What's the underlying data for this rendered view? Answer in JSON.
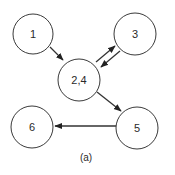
{
  "diagram": {
    "caption": "(a)",
    "nodes": [
      {
        "id": "1",
        "label": "1",
        "cx": 33,
        "cy": 34,
        "r": 20
      },
      {
        "id": "3",
        "label": "3",
        "cx": 135,
        "cy": 34,
        "r": 21
      },
      {
        "id": "2,4",
        "label": "2,4",
        "cx": 79,
        "cy": 80,
        "r": 21
      },
      {
        "id": "6",
        "label": "6",
        "cx": 32,
        "cy": 127,
        "r": 21
      },
      {
        "id": "5",
        "label": "5",
        "cx": 137,
        "cy": 128,
        "r": 21
      }
    ],
    "edges": [
      {
        "from": "1",
        "to": "2,4"
      },
      {
        "from": "2,4",
        "to": "3"
      },
      {
        "from": "3",
        "to": "2,4"
      },
      {
        "from": "2,4",
        "to": "5"
      },
      {
        "from": "5",
        "to": "6"
      }
    ]
  }
}
